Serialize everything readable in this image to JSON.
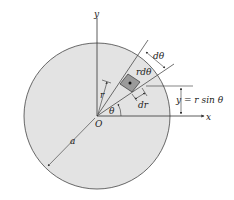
{
  "diagram": {
    "labels": {
      "y_axis": "y",
      "x_axis": "x",
      "origin": "O",
      "radius": "a",
      "r": "r",
      "theta": "θ",
      "d_theta": "dθ",
      "r_d_theta": "rdθ",
      "dr": "dr",
      "y_eq": "y = r sin θ"
    },
    "colors": {
      "disk_fill": "#e3e3e3",
      "element_fill": "#9a9a9a",
      "line": "#333333"
    }
  }
}
